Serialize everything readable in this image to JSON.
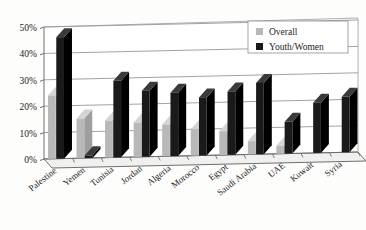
{
  "chart_data": {
    "type": "bar",
    "title": "",
    "subtitle": "",
    "xlabel": "",
    "ylabel": "",
    "ylim": [
      0,
      50
    ],
    "ytick_labels": [
      "0%",
      "10%",
      "20%",
      "30%",
      "40%",
      "50%"
    ],
    "ytick_values": [
      0,
      10,
      20,
      30,
      40,
      50
    ],
    "grid": true,
    "legend_position": "top-right",
    "categories": [
      "Palestine",
      "Yemen",
      "Tunisia",
      "Jordan",
      "Algeria",
      "Morocco",
      "Egypt",
      "Saudi Arabia",
      "UAE",
      "Kuwait",
      "Syria"
    ],
    "series": [
      {
        "name": "Overall",
        "color": "#b8b8b8",
        "values": [
          24,
          15,
          14,
          13,
          12,
          10,
          9,
          5,
          3,
          0,
          0
        ]
      },
      {
        "name": "Youth/Women",
        "color": "#1a1a1a",
        "values": [
          46,
          1,
          29,
          25,
          24,
          22,
          24,
          27,
          12,
          19,
          21
        ]
      }
    ]
  },
  "legend": {
    "items": [
      {
        "label": "Overall",
        "swatch": "#b8b8b8"
      },
      {
        "label": "Youth/Women",
        "swatch": "#1a1a1a"
      }
    ]
  },
  "colors": {
    "overall": "#b8b8b8",
    "youth_women": "#1a1a1a",
    "gridline": "#8c8c8c",
    "axis": "#6e6e6e",
    "background": "#fdfdfb",
    "floor": "#f0f0ee"
  }
}
